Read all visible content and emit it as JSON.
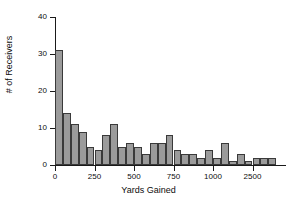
{
  "chart_data": {
    "type": "bar",
    "title": "",
    "xlabel": "Yards Gained",
    "ylabel": "# of Receivers",
    "grid": false,
    "legend": false,
    "ylim": [
      0,
      40
    ],
    "yticks": [
      0,
      10,
      20,
      30,
      40
    ],
    "ytick_labels": [
      "0",
      "10",
      "20",
      "30",
      "40"
    ],
    "xtick_labels": [
      "0",
      "250",
      "500",
      "750",
      "1000",
      "2500"
    ],
    "xtick_positions": [
      0,
      250,
      500,
      750,
      1000,
      1250
    ],
    "bin_width": 50,
    "bin_starts": [
      0,
      50,
      100,
      150,
      200,
      250,
      300,
      350,
      400,
      450,
      500,
      550,
      600,
      650,
      700,
      750,
      800,
      850,
      900,
      950,
      1000,
      1050,
      1100,
      1150,
      1200,
      1250,
      1300,
      1350,
      1400,
      1450
    ],
    "values": [
      31,
      14,
      11,
      9,
      5,
      4,
      8,
      11,
      5,
      6,
      5,
      3,
      6,
      6,
      8,
      4,
      3,
      3,
      2,
      4,
      2,
      6,
      1,
      3,
      1,
      2,
      2,
      2,
      0,
      0
    ],
    "bar_fill": "#9b9b9b",
    "bar_edge": "#3a3a3a",
    "axis_color": "#1a1a1a",
    "background": "#ffffff"
  }
}
